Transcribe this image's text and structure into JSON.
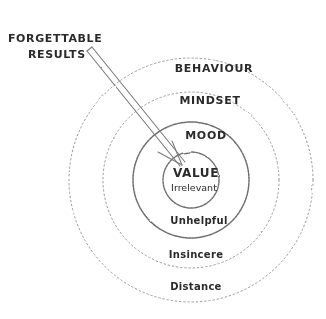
{
  "diagram": {
    "background_color": "#ffffff",
    "ink_color": "#2b2b2b",
    "stroke_color": "#8c8c8c",
    "stroke_color_dark": "#6e6e6e",
    "center": {
      "x": 191,
      "y": 180
    },
    "callout": {
      "line1": "FORGETTABLE",
      "line2": "RESULTS",
      "arrow_from": {
        "x": 86,
        "y": 54
      },
      "arrow_to": {
        "x": 178,
        "y": 168
      }
    },
    "rings": [
      {
        "name": "behaviour",
        "radius": 122,
        "style": "dotted",
        "upper_label": "BEHAVIOUR",
        "upper_label_case": "upper",
        "upper_label_y": 72,
        "lower_label": "Distance",
        "lower_label_case": "title",
        "lower_label_y": 290
      },
      {
        "name": "mindset",
        "radius": 88,
        "style": "dotted",
        "upper_label": "MINDSET",
        "upper_label_case": "upper",
        "upper_label_y": 104,
        "lower_label": "Insincere",
        "lower_label_case": "title",
        "lower_label_y": 258
      },
      {
        "name": "mood",
        "radius": 58,
        "style": "solid",
        "upper_label": "MOOD",
        "upper_label_case": "upper",
        "upper_label_y": 139,
        "lower_label": "Unhelpful",
        "lower_label_case": "title",
        "lower_label_y": 224
      },
      {
        "name": "value",
        "radius": 28,
        "style": "solid",
        "upper_label": "VALUE",
        "upper_label_case": "upper",
        "upper_label_y": 176,
        "lower_label": "Irrelevant",
        "lower_label_case": "title",
        "lower_label_y": 191
      }
    ]
  }
}
